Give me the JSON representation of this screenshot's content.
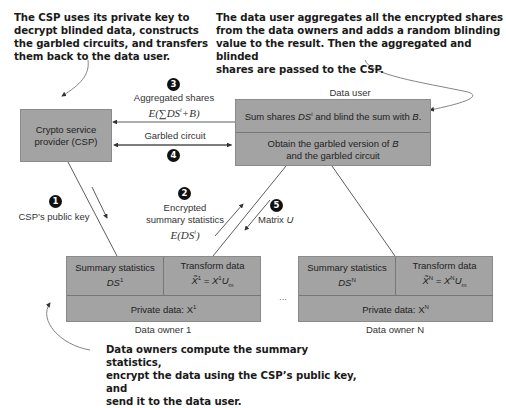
{
  "callouts": {
    "csp": [
      "The CSP uses its private key to",
      "decrypt blinded data, constructs",
      "the garbled circuits, and transfers",
      "them back to the data user."
    ],
    "data_user": [
      "The data user aggregates all the encrypted shares",
      "from the data owners and adds a random blinding",
      "value to the result. Then the aggregated and blinded",
      "shares are passed to the CSP."
    ],
    "data_owners": [
      "Data owners compute the summary statistics,",
      "encrypt the data using the CSP’s public key, and",
      "send it to the data user."
    ]
  },
  "csp_box": {
    "line1": "Crypto service",
    "line2": "provider (CSP)"
  },
  "data_user_box": {
    "title": "Data user",
    "step1_pre": "Sum shares ",
    "step1_var": "DS",
    "step1_sup": "i",
    "step1_mid": " and blind the sum with ",
    "step1_b": "B",
    "step1_end": ".",
    "step2_line1_pre": "Obtain the garbled version of ",
    "step2_line1_var": "B",
    "step2_line2": "and the garbled circuit"
  },
  "flows": {
    "step1": {
      "number": "1",
      "label": "CSP’s public key"
    },
    "step2": {
      "number": "2",
      "line1": "Encrypted",
      "line2": "summary statistics",
      "math": "E(DS",
      "math_sup": "i",
      "math_end": ")"
    },
    "step3": {
      "number": "3",
      "label": "Aggregated shares",
      "math": "E(∑DS",
      "math_sup": "i",
      "math_end": "+B)"
    },
    "step4": {
      "number": "4",
      "label": "Garbled circuit"
    },
    "step5": {
      "number": "5",
      "label_pre": "Matrix ",
      "label_var": "U"
    }
  },
  "owner1": {
    "summary_label": "Summary statistics",
    "summary_var": "DS",
    "summary_sup": "1",
    "transform_label": "Transform data",
    "transform_lhs": "X̃",
    "transform_lhs_sup": "1",
    "transform_eq": " = X",
    "transform_rhs_sup": "1",
    "transform_u": "U",
    "transform_sub": "m",
    "private_label": "Private data: X",
    "private_sup": "1",
    "caption": "Data owner 1"
  },
  "ownerN": {
    "summary_label": "Summary statistics",
    "summary_var": "DS",
    "summary_sup": "N",
    "transform_label": "Transform data",
    "transform_lhs": "X̃",
    "transform_lhs_sup": "N",
    "transform_eq": " = X",
    "transform_rhs_sup": "N",
    "transform_u": "U",
    "transform_sub": "m",
    "private_label": "Private data: X",
    "private_sup": "N",
    "caption": "Data owner N"
  },
  "ellipsis": "..."
}
